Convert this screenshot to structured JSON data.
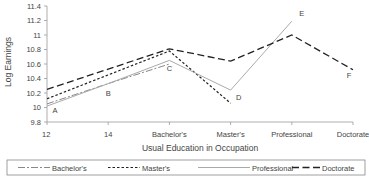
{
  "chart_data": {
    "type": "line",
    "title": "",
    "xlabel": "Usual Education in Occupation",
    "ylabel": "Log Earnings",
    "categories": [
      "12",
      "14",
      "Bachelor's",
      "Master's",
      "Professional",
      "Doctorate"
    ],
    "ylim": [
      9.8,
      11.4
    ],
    "yticks": [
      "9.8",
      "10",
      "10.2",
      "10.4",
      "10.6",
      "10.8",
      "11",
      "11.2",
      "11.4"
    ],
    "grid": false,
    "legend_position": "bottom",
    "series": [
      {
        "name": "Bachelor's",
        "style": "dash-dot",
        "color": "#888888",
        "values": [
          10.05,
          10.33,
          10.6,
          null,
          null,
          null
        ]
      },
      {
        "name": "Master's",
        "style": "dotted",
        "color": "#222222",
        "values": [
          10.12,
          10.45,
          10.78,
          10.06,
          null,
          null
        ]
      },
      {
        "name": "Professional",
        "style": "solid",
        "color": "#aaaaaa",
        "values": [
          10.02,
          10.33,
          10.65,
          10.24,
          11.19,
          null
        ]
      },
      {
        "name": "Doctorate",
        "style": "long-dash",
        "color": "#222222",
        "values": [
          10.25,
          10.53,
          10.81,
          10.64,
          11.0,
          10.52
        ]
      }
    ],
    "annotations": [
      {
        "text": "A",
        "x": "12",
        "y": 9.97
      },
      {
        "text": "B",
        "x": "14",
        "y": 10.2
      },
      {
        "text": "C",
        "x": "Bachelor's",
        "y": 10.55
      },
      {
        "text": "D",
        "x": "Master's",
        "y": 10.15
      },
      {
        "text": "E",
        "x": "Professional",
        "y": 11.3
      },
      {
        "text": "F",
        "x": "Doctorate",
        "y": 10.45
      }
    ]
  }
}
